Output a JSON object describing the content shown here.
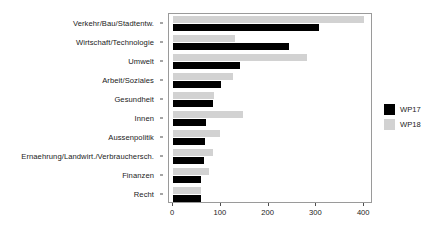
{
  "chart_data": {
    "type": "bar",
    "orientation": "horizontal",
    "title": "",
    "xlabel": "",
    "ylabel": "",
    "xlim": [
      0,
      410
    ],
    "xticks": [
      0,
      100,
      200,
      300,
      400
    ],
    "xtick_labels": [
      "0",
      "100",
      "200",
      "300",
      "400"
    ],
    "grid": false,
    "legend_position": "right",
    "categories": [
      "Verkehr/Bau/Stadtentw.",
      "Wirtschaft/Technologie",
      "Umwelt",
      "Arbeit/Soziales",
      "Gesundheit",
      "Innen",
      "Aussenpolitik",
      "Ernaehrung/Landwirt./Verbrauchersch.",
      "Finanzen",
      "Recht"
    ],
    "series": [
      {
        "name": "WP17",
        "color": "#000000",
        "values": [
          305,
          243,
          141,
          101,
          84,
          68,
          67,
          64,
          59,
          58
        ]
      },
      {
        "name": "WP18",
        "color": "#d2d2d2",
        "values": [
          399,
          130,
          281,
          125,
          85,
          146,
          98,
          83,
          75,
          58
        ]
      }
    ]
  },
  "legend": {
    "items": [
      {
        "label": "WP17",
        "color": "#000000"
      },
      {
        "label": "WP18",
        "color": "#d2d2d2"
      }
    ]
  }
}
